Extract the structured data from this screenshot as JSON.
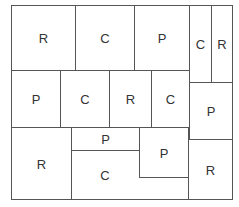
{
  "diagram": {
    "type": "floorplan-partition",
    "line_color": "#555555",
    "cells": [
      {
        "id": "r1c1",
        "label": "R",
        "x": 11,
        "y": 5,
        "w": 65,
        "h": 66
      },
      {
        "id": "r1c2",
        "label": "C",
        "x": 75,
        "y": 5,
        "w": 60,
        "h": 66
      },
      {
        "id": "r1c3",
        "label": "P",
        "x": 134,
        "y": 5,
        "w": 56,
        "h": 66
      },
      {
        "id": "r1c4",
        "label": "C",
        "x": 189,
        "y": 5,
        "w": 23,
        "h": 78
      },
      {
        "id": "r1c5",
        "label": "R",
        "x": 211,
        "y": 5,
        "w": 22,
        "h": 78
      },
      {
        "id": "r2c1",
        "label": "P",
        "x": 11,
        "y": 70,
        "w": 50,
        "h": 58
      },
      {
        "id": "r2c2",
        "label": "C",
        "x": 60,
        "y": 70,
        "w": 50,
        "h": 58
      },
      {
        "id": "r2c3",
        "label": "R",
        "x": 109,
        "y": 70,
        "w": 43,
        "h": 58
      },
      {
        "id": "r2c4",
        "label": "C",
        "x": 151,
        "y": 70,
        "w": 39,
        "h": 58
      },
      {
        "id": "r2c5",
        "label": "P",
        "x": 189,
        "y": 82,
        "w": 44,
        "h": 58
      },
      {
        "id": "r3c1",
        "label": "R",
        "x": 11,
        "y": 127,
        "w": 61,
        "h": 73
      },
      {
        "id": "r3c2",
        "label": "C",
        "x": 71,
        "y": 127,
        "w": 118,
        "h": 73,
        "label_x": 105,
        "label_y": 175
      },
      {
        "id": "r3c3",
        "label": "P",
        "x": 71,
        "y": 127,
        "w": 69,
        "h": 24
      },
      {
        "id": "r3c4",
        "label": "P",
        "x": 139,
        "y": 127,
        "w": 50,
        "h": 51
      },
      {
        "id": "r3c5",
        "label": "R",
        "x": 188,
        "y": 139,
        "w": 45,
        "h": 61
      }
    ]
  }
}
